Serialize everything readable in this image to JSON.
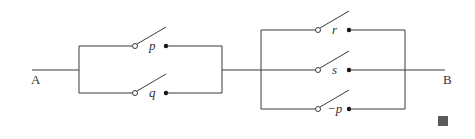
{
  "diagram": {
    "type": "switching-circuit",
    "nodes": {
      "start_label": "A",
      "end_label": "B"
    },
    "left_block": {
      "arrangement": "parallel",
      "switches": [
        {
          "label": "p",
          "y": 46
        },
        {
          "label": "q",
          "y": 93
        }
      ]
    },
    "right_block": {
      "arrangement": "parallel",
      "switches": [
        {
          "label": "r",
          "y": 30
        },
        {
          "label": "s",
          "y": 70
        },
        {
          "label": "−p",
          "y": 109
        }
      ]
    },
    "connection": "series",
    "colors": {
      "wire": "#3a3a3a",
      "marker": "#5a5a5a"
    }
  }
}
